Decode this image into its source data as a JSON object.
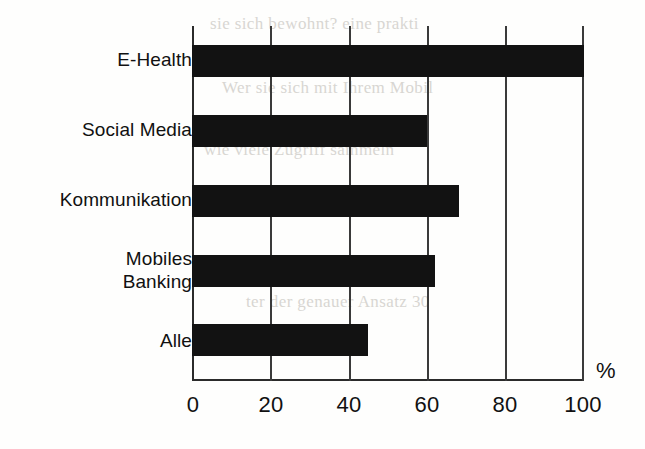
{
  "chart_data": {
    "type": "bar",
    "orientation": "horizontal",
    "title": "",
    "subtitle": "",
    "xlabel": "%",
    "ylabel": "",
    "categories": [
      "E-Health",
      "Social Media",
      "Kommunikation",
      "Mobiles\nBanking",
      "Alle"
    ],
    "values": [
      100,
      60,
      68,
      62,
      45
    ],
    "series": [
      {
        "name": "Anteil",
        "values": [
          100,
          60,
          68,
          62,
          45
        ]
      }
    ],
    "xlim": [
      0,
      100
    ],
    "xticks": [
      0,
      20,
      40,
      60,
      80,
      100
    ],
    "xtick_labels": [
      "0",
      "20",
      "40",
      "60",
      "80",
      "100"
    ],
    "unit": "%",
    "grid": true,
    "grid_axis": "x",
    "legend": false,
    "legend_position": "none",
    "bar_color": "#121212",
    "axis_color": "#2b2b2b",
    "background_color": "#fefefd"
  },
  "figure": {
    "unit_label": "%",
    "bleed_text": [
      "sie sich bewohnt? eine prakti",
      "Wer sie sich mit Ihrem Mobil",
      "wie viele Zugriff sammeln",
      "das ein dieser Anwendungen",
      "Bankkunde mit dem Mobile",
      "ter der genauer Ansatz 30",
      "insbesondere"
    ]
  }
}
